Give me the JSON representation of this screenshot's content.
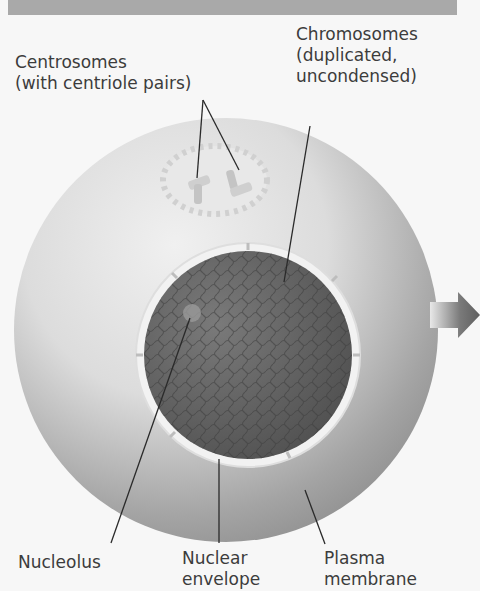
{
  "diagram": {
    "labels": {
      "centrosomes": "Centrosomes\n(with centriole pairs)",
      "chromosomes": "Chromosomes\n(duplicated,\nuncondensed)",
      "nucleolus": "Nucleolus",
      "nuclear_envelope": "Nuclear\nenvelope",
      "plasma_membrane": "Plasma\nmembrane"
    },
    "colors": {
      "header": "#a9a9a9",
      "cell_light": "#e6e6e6",
      "cell_dark": "#8e8e8e",
      "nucleus": "#5e5e5e",
      "arrow": "#6d6d6d"
    }
  }
}
